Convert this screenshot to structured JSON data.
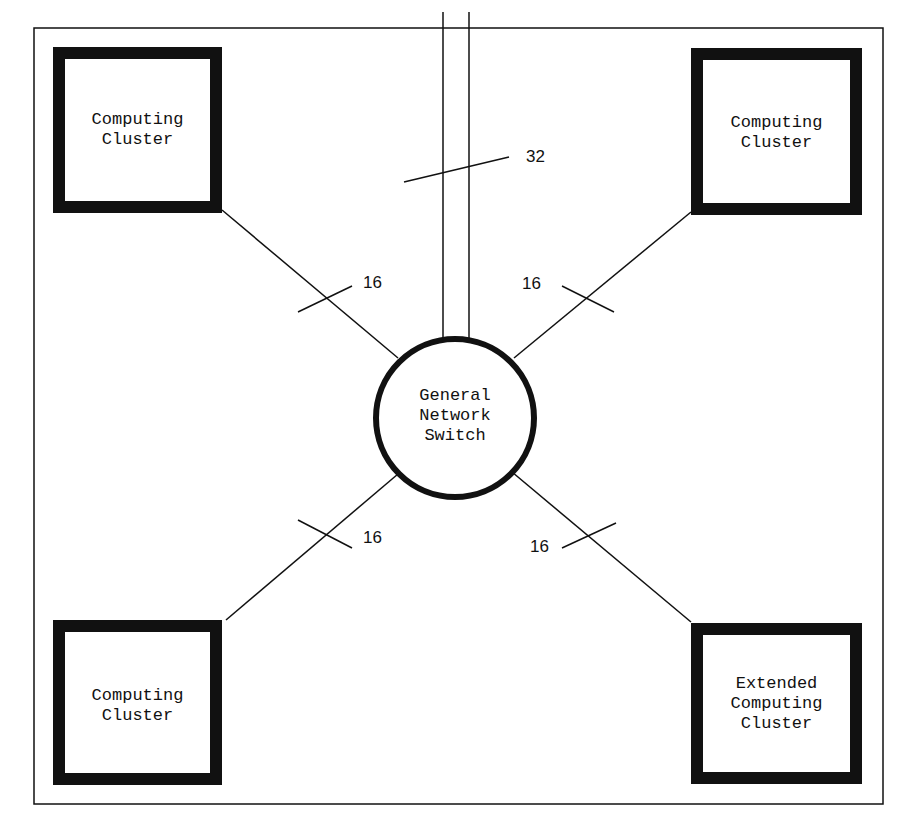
{
  "diagram": {
    "nodes": [
      {
        "id": "tl",
        "label_lines": [
          "Computing",
          "Cluster"
        ]
      },
      {
        "id": "tr",
        "label_lines": [
          "Computing",
          "Cluster"
        ]
      },
      {
        "id": "bl",
        "label_lines": [
          "Computing",
          "Cluster"
        ]
      },
      {
        "id": "br",
        "label_lines": [
          "Extended",
          "Computing",
          "Cluster"
        ]
      },
      {
        "id": "switch",
        "label_lines": [
          "General",
          "Network",
          "Switch"
        ]
      }
    ],
    "links": [
      {
        "from": "tl",
        "to": "switch",
        "count": "16"
      },
      {
        "from": "tr",
        "to": "switch",
        "count": "16"
      },
      {
        "from": "bl",
        "to": "switch",
        "count": "16"
      },
      {
        "from": "br",
        "to": "switch",
        "count": "16"
      },
      {
        "from": "external",
        "to": "switch",
        "count": "32"
      }
    ]
  }
}
